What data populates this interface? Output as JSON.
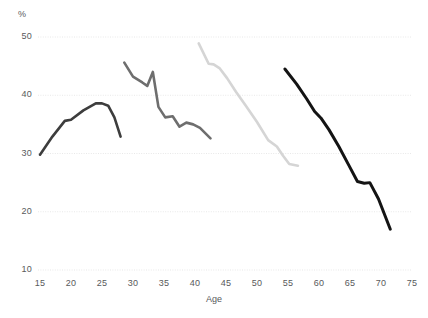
{
  "chart_data": {
    "type": "line",
    "title": "",
    "subtitle": "",
    "xlabel": "Age",
    "ylabel": "%",
    "unit_label": "%",
    "xlim": [
      15,
      75
    ],
    "ylim": [
      10,
      50
    ],
    "x_ticks": [
      15,
      20,
      25,
      30,
      35,
      40,
      45,
      50,
      55,
      60,
      65,
      70,
      75
    ],
    "y_ticks": [
      10,
      20,
      30,
      40,
      50
    ],
    "x_tick_labels": [
      "15",
      "20",
      "25",
      "30",
      "35",
      "40",
      "45",
      "50",
      "55",
      "60",
      "65",
      "70",
      "75"
    ],
    "y_tick_labels": [
      "10",
      "20",
      "30",
      "40",
      "50"
    ],
    "grid": "horizontal-dotted",
    "legend": "none",
    "gridline_color": "#e8e8e8",
    "axis_text_color": "#58595b",
    "background_color": "#ffffff",
    "series": [
      {
        "name": "Cohort 1",
        "color": "#3d3d3d",
        "stroke_width": 2.6,
        "x": [
          15,
          17,
          19,
          20,
          22,
          24,
          25,
          26,
          27,
          28
        ],
        "values": [
          29.8,
          32.9,
          35.6,
          35.8,
          37.4,
          38.6,
          38.6,
          38.2,
          36.2,
          32.9
        ]
      },
      {
        "name": "Cohort 2",
        "color": "#6e6e6e",
        "stroke_width": 2.6,
        "x": [
          28.6,
          30,
          31.5,
          32.3,
          33.2,
          34.1,
          35.2,
          36.4,
          37.5,
          38.6,
          39.7,
          40.8,
          42.5
        ],
        "values": [
          45.6,
          43.2,
          42.2,
          41.6,
          44.0,
          38.0,
          36.2,
          36.4,
          34.6,
          35.3,
          35.0,
          34.4,
          32.6
        ]
      },
      {
        "name": "Cohort 3",
        "color": "#d5d5d5",
        "stroke_width": 2.6,
        "x": [
          40.6,
          42.2,
          43.0,
          44.0,
          45.2,
          46.6,
          48.2,
          50.0,
          51.8,
          53.2,
          54.2,
          55.2,
          56.6
        ],
        "values": [
          48.9,
          45.4,
          45.3,
          44.6,
          42.9,
          40.6,
          38.2,
          35.4,
          32.3,
          31.2,
          29.6,
          28.2,
          27.9
        ]
      },
      {
        "name": "Cohort 4",
        "color": "#141414",
        "stroke_width": 3.0,
        "x": [
          54.5,
          56.4,
          58.0,
          59.3,
          60.3,
          61.6,
          63.2,
          64.8,
          66.2,
          67.3,
          68.2,
          69.6,
          71.5
        ],
        "values": [
          44.5,
          41.9,
          39.4,
          37.2,
          36.1,
          34.1,
          31.2,
          28.0,
          25.2,
          24.9,
          25.0,
          22.2,
          17.0
        ]
      }
    ]
  },
  "layout": {
    "plot_left_px": 40,
    "plot_right_px": 412,
    "plot_top_px": 37,
    "plot_bottom_px": 270
  }
}
